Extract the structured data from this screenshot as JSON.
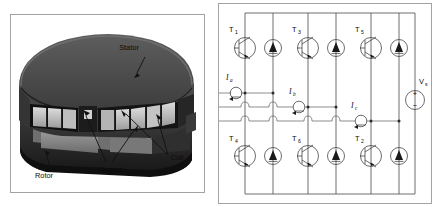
{
  "figure": {
    "panels": [
      "motor-cutaway",
      "three-phase-inverter"
    ]
  },
  "motor": {
    "labels": {
      "stator": "Stator",
      "rotor": "Rotor",
      "magnet": "Magnet",
      "coil": "Coil"
    },
    "colors": {
      "stator_dark": "#4a4a4a",
      "stator_top": "#545454",
      "body_dark": "#2a2a2a",
      "coil_light": "#c9c9c9",
      "coil_mid": "#a8a8a8",
      "magnet_gray": "#8d8d8d",
      "frame": "#9a9a9a",
      "highlight": "#e2e2e2"
    }
  },
  "circuit": {
    "transistors": [
      {
        "id": "T1",
        "label": "T",
        "sub": "1",
        "position": "upper-left"
      },
      {
        "id": "T3",
        "label": "T",
        "sub": "3",
        "position": "upper-middle"
      },
      {
        "id": "T5",
        "label": "T",
        "sub": "5",
        "position": "upper-right"
      },
      {
        "id": "T4",
        "label": "T",
        "sub": "4",
        "position": "lower-left"
      },
      {
        "id": "T6",
        "label": "T",
        "sub": "6",
        "position": "lower-middle"
      },
      {
        "id": "T2",
        "label": "T",
        "sub": "2",
        "position": "lower-right"
      }
    ],
    "currents": [
      {
        "id": "Ia",
        "label": "I",
        "sub": "a",
        "phase": "a"
      },
      {
        "id": "Ib",
        "label": "I",
        "sub": "b",
        "phase": "b"
      },
      {
        "id": "Ic",
        "label": "I",
        "sub": "c",
        "phase": "c"
      }
    ],
    "source": {
      "id": "Vs",
      "label": "V",
      "sub": "s",
      "plus": "+",
      "minus": "−"
    },
    "colors": {
      "wire": "#4a4a4a",
      "symbol": "#3c3c3c",
      "frame": "#9a9a9a",
      "text": "#0b0b0b"
    }
  }
}
